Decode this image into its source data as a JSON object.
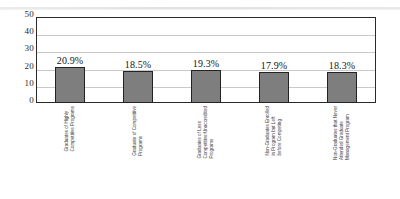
{
  "chart_data": {
    "type": "bar",
    "title": "",
    "subtitle": "",
    "xlabel": "",
    "ylabel": "",
    "ylim": [
      0,
      50
    ],
    "yticks": [
      50,
      40,
      30,
      20,
      10,
      0
    ],
    "grid": true,
    "legend": "none",
    "orientation": "vertical",
    "value_label_format": "percent-one-decimal",
    "categories": [
      "Graduates of Highly Competitive Programs",
      "Graduate of Competitive Programs",
      "Graduates of Less Competitive/Unaccredited Programs",
      "Non-Graduates Enrolled in Program but Left before Competing",
      "Non-Graduates that Never Attended Graduate Management Program"
    ],
    "category_lines": [
      [
        "Graduates of Highly",
        "Competitive Programs"
      ],
      [
        "Graduate of Competitive",
        "Programs"
      ],
      [
        "Graduates of Less",
        "Competitive/Unaccredited",
        "Programs"
      ],
      [
        "Non-Graduates Enrolled",
        "in Program but Left",
        "before Competing"
      ],
      [
        "Non-Graduates that Never",
        "Attended Graduate",
        "Management Program"
      ]
    ],
    "values": [
      20.9,
      18.5,
      19.3,
      17.9,
      18.3
    ],
    "value_labels": [
      "20.9%",
      "18.5%",
      "19.3%",
      "17.9%",
      "18.3%"
    ],
    "colors": {
      "bar_fill": "#7e7e7e",
      "bar_border": "#232323",
      "plot_border": "#2a2a2a",
      "gridline": "#c9c9c9",
      "background": "#ffffff",
      "text": "#1a1a1a"
    }
  }
}
